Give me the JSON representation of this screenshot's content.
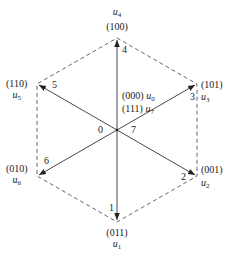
{
  "diagram": {
    "type": "space-vector-hexagon",
    "center": {
      "x": 117,
      "y": 130
    },
    "colors": {
      "line": "#333333",
      "dashed": "#555555",
      "text": "#222222"
    },
    "vectors": [
      {
        "id": "u4",
        "symbol": "u",
        "sub": "4",
        "code": "(100)",
        "sector": "4",
        "angle_deg": 90
      },
      {
        "id": "u6",
        "symbol": "u",
        "sub": "6",
        "code": "(110)",
        "sector": "5",
        "angle_deg": 150
      },
      {
        "id": "u2",
        "symbol": "u",
        "sub": "2",
        "code": "(010)",
        "sector": "6",
        "angle_deg": 210
      },
      {
        "id": "u3",
        "symbol": "u",
        "sub": "3",
        "code": "(011)",
        "sector": "1",
        "angle_deg": 270
      },
      {
        "id": "u1",
        "symbol": "u",
        "sub": "1",
        "code": "(001)",
        "sector": "2",
        "angle_deg": 330
      },
      {
        "id": "u5",
        "symbol": "u",
        "sub": "5",
        "code": "(101)",
        "sector": "3",
        "angle_deg": 30
      }
    ],
    "labels": {
      "top": {
        "code": "(100)",
        "symbol": "u",
        "sub": "4",
        "sector": "4"
      },
      "upper_left": {
        "code": "(110)",
        "symbol": "u",
        "sub": "5",
        "sector": "5"
      },
      "upper_right": {
        "code": "(101)",
        "symbol": "u",
        "sub": "3",
        "sector": "3"
      },
      "lower_left": {
        "code": "(010)",
        "symbol": "u",
        "sub": "6",
        "sector": "6"
      },
      "lower_right": {
        "code": "(001)",
        "symbol": "u",
        "sub": "2",
        "sector": "2"
      },
      "bottom": {
        "code": "(011)",
        "symbol": "u",
        "sub": "1",
        "sector": "1"
      }
    },
    "zero_vectors": [
      {
        "code": "(000)",
        "symbol": "u",
        "sub": "0"
      },
      {
        "code": "(111)",
        "symbol": "u",
        "sub": "7"
      }
    ],
    "center_labels": {
      "left": "0",
      "right": "7"
    }
  }
}
